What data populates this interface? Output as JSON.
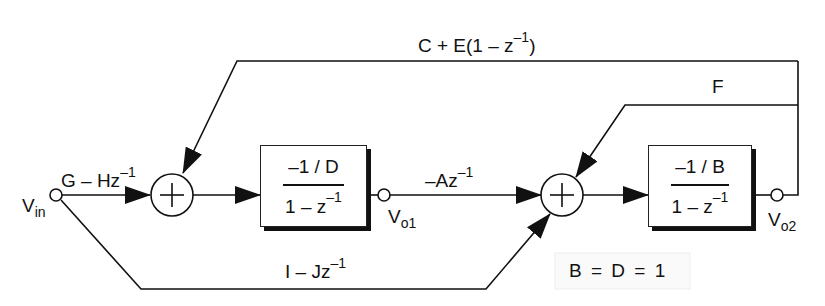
{
  "diagram": {
    "type": "block-diagram",
    "input": {
      "label": "V",
      "sub": "in"
    },
    "gains": {
      "forward_input": {
        "text": "G – Hz",
        "exp": "–1"
      },
      "feedforward_bottom": {
        "text": "I – Jz",
        "exp": "–1"
      },
      "inter_stage": {
        "text": "–Az",
        "exp": "–1"
      },
      "feedback_outer": {
        "text": "C + E(1 – z",
        "exp": "–1",
        "close": ")"
      },
      "feedback_inner": {
        "text": "F"
      }
    },
    "blocks": [
      {
        "id": "integrator-1",
        "numerator": "–1 / D",
        "denominator": "1 – z",
        "den_exp": "–1"
      },
      {
        "id": "integrator-2",
        "numerator": "–1 / B",
        "denominator": "1 – z",
        "den_exp": "–1"
      }
    ],
    "nodes": [
      {
        "id": "vo1",
        "label": "V",
        "sub": "o1"
      },
      {
        "id": "vo2",
        "label": "V",
        "sub": "o2"
      }
    ],
    "summers": [
      {
        "id": "sum-1",
        "symbol": "+"
      },
      {
        "id": "sum-2",
        "symbol": "+"
      }
    ],
    "note": "B = D = 1",
    "colors": {
      "line": "#111111",
      "background": "#ffffff"
    }
  }
}
